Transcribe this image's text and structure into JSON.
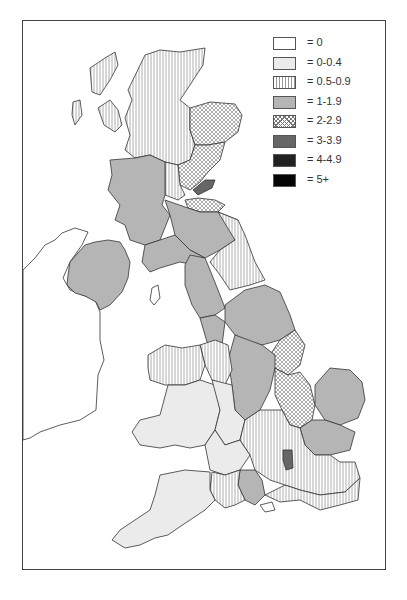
{
  "legend": {
    "items": [
      {
        "label": "= 0",
        "class": "0"
      },
      {
        "label": "= 0-0.4",
        "class": "0-0.4"
      },
      {
        "label": "= 0.5-0.9",
        "class": "0.5-0.9"
      },
      {
        "label": "= 1-1.9",
        "class": "1-1.9"
      },
      {
        "label": "= 2-2.9",
        "class": "2-2.9"
      },
      {
        "label": "= 3-3.9",
        "class": "3-3.9"
      },
      {
        "label": "= 4-4.9",
        "class": "4-4.9"
      },
      {
        "label": "= 5+",
        "class": "5+"
      }
    ]
  },
  "map": {
    "type": "choropleth",
    "area": "United Kingdom counties/regions",
    "regions": [
      {
        "name": "Scottish Highlands",
        "class": "0.5-0.9"
      },
      {
        "name": "Grampian",
        "class": "2-2.9"
      },
      {
        "name": "Tayside",
        "class": "2-2.9"
      },
      {
        "name": "Central Scotland",
        "class": "0.5-0.9"
      },
      {
        "name": "Fife",
        "class": "3-3.9"
      },
      {
        "name": "Lothian",
        "class": "2-2.9"
      },
      {
        "name": "Strathclyde",
        "class": "1-1.9"
      },
      {
        "name": "Borders",
        "class": "1-1.9"
      },
      {
        "name": "Dumfries and Galloway",
        "class": "1-1.9"
      },
      {
        "name": "Western Isles",
        "class": "0.5-0.9"
      },
      {
        "name": "Northern Ireland",
        "class": "1-1.9"
      },
      {
        "name": "Northumberland",
        "class": "0.5-0.9"
      },
      {
        "name": "Cumbria",
        "class": "1-1.9"
      },
      {
        "name": "North Yorkshire",
        "class": "1-1.9"
      },
      {
        "name": "Lincolnshire",
        "class": "2-2.9"
      },
      {
        "name": "Humberside",
        "class": "2-2.9"
      },
      {
        "name": "Cambridgeshire",
        "class": "2-2.9"
      },
      {
        "name": "Norfolk",
        "class": "1-1.9"
      },
      {
        "name": "Suffolk",
        "class": "1-1.9"
      },
      {
        "name": "Wales",
        "class": "0-0.4"
      },
      {
        "name": "North Wales",
        "class": "0.5-0.9"
      },
      {
        "name": "South West England",
        "class": "0-0.4"
      },
      {
        "name": "Hampshire",
        "class": "1-1.9"
      },
      {
        "name": "Central London area",
        "class": "3-3.9"
      },
      {
        "name": "Dorset",
        "class": "0.5-0.9"
      },
      {
        "name": "Kent/Sussex",
        "class": "0.5-0.9"
      },
      {
        "name": "Isle of Man",
        "class": "0"
      },
      {
        "name": "Republic of Ireland",
        "class": "0"
      }
    ]
  }
}
